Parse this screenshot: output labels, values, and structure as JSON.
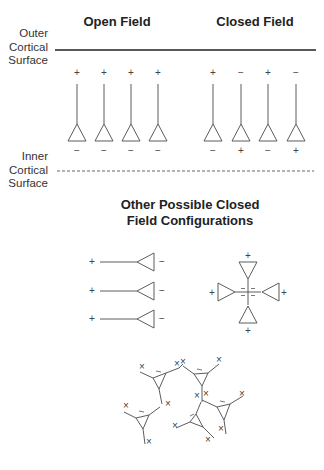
{
  "headings": {
    "open_field": "Open Field",
    "closed_field": "Closed Field",
    "other_configs_line1": "Other Possible Closed",
    "other_configs_line2": "Field Configurations"
  },
  "surface_labels": {
    "outer": [
      "Outer",
      "Cortical",
      "Surface"
    ],
    "inner": [
      "Inner",
      "Cortical",
      "Surface"
    ]
  },
  "open_field_neurons": [
    {
      "top": "+",
      "bottom": "−"
    },
    {
      "top": "+",
      "bottom": "−"
    },
    {
      "top": "+",
      "bottom": "−"
    },
    {
      "top": "+",
      "bottom": "−"
    }
  ],
  "closed_field_neurons": [
    {
      "top": "+",
      "bottom": "−"
    },
    {
      "top": "−",
      "bottom": "+"
    },
    {
      "top": "+",
      "bottom": "−"
    },
    {
      "top": "−",
      "bottom": "+"
    }
  ],
  "horizontal_neurons": [
    {
      "left": "+",
      "right": "−"
    },
    {
      "left": "+",
      "right": "−"
    },
    {
      "left": "+",
      "right": "−"
    }
  ],
  "radial_configuration": {
    "outer_sign": "+",
    "center_signs": [
      "=",
      "=",
      "=",
      "="
    ]
  },
  "network_configuration": {
    "marker_sign": "×",
    "soma_sign": "−"
  },
  "colors": {
    "line": "#4a4a4a",
    "text": "#333333",
    "background": "#ffffff"
  }
}
